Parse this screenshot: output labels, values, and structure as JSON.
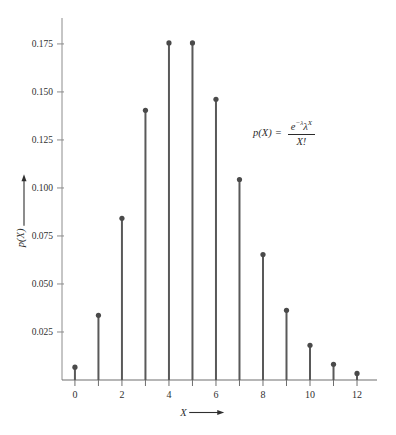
{
  "chart_data": {
    "type": "bar",
    "subtype": "stem",
    "title": "",
    "subtitle": "",
    "xlabel": "X",
    "ylabel": "p(X)",
    "xlabel_arrow": "→",
    "ylabel_arrow": "↑",
    "categories": [
      0,
      1,
      2,
      3,
      4,
      5,
      6,
      7,
      8,
      9,
      10,
      11,
      12
    ],
    "values": [
      0.0067,
      0.0337,
      0.0842,
      0.1404,
      0.1755,
      0.1755,
      0.1462,
      0.1044,
      0.0653,
      0.0363,
      0.0181,
      0.0082,
      0.0034
    ],
    "x": [
      0,
      1,
      2,
      3,
      4,
      5,
      6,
      7,
      8,
      9,
      10,
      11,
      12
    ],
    "xlim": [
      -0.55,
      12.85
    ],
    "ylim": [
      0,
      0.1885
    ],
    "xticks": [
      0,
      1,
      2,
      3,
      4,
      5,
      6,
      7,
      8,
      9,
      10,
      11,
      12
    ],
    "xtick_labels": [
      "0",
      "",
      "2",
      "",
      "4",
      "",
      "6",
      "",
      "8",
      "",
      "10",
      "",
      "12"
    ],
    "yticks": [
      0.025,
      0.05,
      0.075,
      0.1,
      0.125,
      0.15,
      0.175
    ],
    "ytick_labels": [
      "0.025",
      "0.050",
      "0.075",
      "0.100",
      "0.125",
      "0.150",
      "0.175"
    ],
    "grid": false,
    "legend": null,
    "annotations": [
      {
        "name": "poisson-pmf-formula",
        "text": "p(X) = e^(-λ)λ^X / X!",
        "lhs": "p(X)",
        "equals": "=",
        "numerator_base": "e",
        "numerator_exponent": "−λ",
        "numerator_lambda": "λ",
        "numerator_lambda_exponent": "X",
        "denominator": "X!"
      }
    ],
    "colors": {
      "stem": "#595959",
      "marker": "#4a4a4a",
      "axis": "#8c8c8c",
      "baseline": "#6e6e6e",
      "text": "#2f2f2f",
      "background": "#ffffff"
    }
  }
}
